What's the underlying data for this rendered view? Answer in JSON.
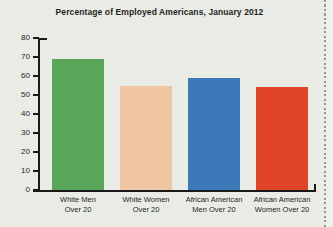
{
  "page": {
    "background_color": "#e9ebe5",
    "edge_strip_color": "#eef0ea",
    "perforation_color": "#8f978f",
    "text_color": "#1f1f1f",
    "axis_color": "#1a1a1a"
  },
  "chart_data": {
    "type": "bar",
    "title": "Percentage of Employed Americans, January 2012",
    "categories": [
      "White Men Over 20",
      "White Women Over 20",
      "African American Men Over 20",
      "African American Women Over 20"
    ],
    "category_lines": [
      [
        "White Men",
        "Over 20"
      ],
      [
        "White Women",
        "Over 20"
      ],
      [
        "African American",
        "Men Over 20"
      ],
      [
        "African American",
        "Women Over 20"
      ]
    ],
    "values": [
      69,
      55,
      59,
      54
    ],
    "bar_colors": [
      "#58a65a",
      "#f0c5a3",
      "#3b79b8",
      "#df4526"
    ],
    "xlabel": "",
    "ylabel": "",
    "ylim": [
      0,
      80
    ],
    "yticks": [
      0,
      10,
      20,
      30,
      40,
      50,
      60,
      70,
      80
    ],
    "grid": false,
    "legend": false
  }
}
